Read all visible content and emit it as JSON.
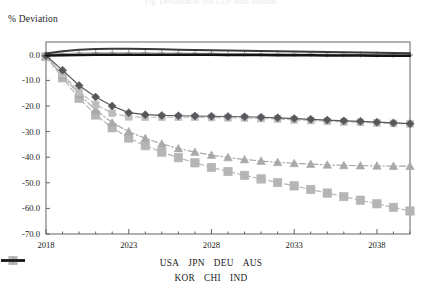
{
  "figure": {
    "title_partial": "Fig. Deviation of real GDP from baseline",
    "y_axis_title": "% Deviation"
  },
  "chart_data": {
    "type": "line",
    "title": "% Deviation",
    "xlabel": "",
    "ylabel": "% Deviation",
    "xlim": [
      2018,
      2040
    ],
    "ylim": [
      -70,
      5
    ],
    "yticks": [
      "0.0",
      "-10.0",
      "-20.0",
      "-30.0",
      "-40.0",
      "-50.0",
      "-60.0",
      "-70.0"
    ],
    "ytick_values": [
      0,
      -10,
      -20,
      -30,
      -40,
      -50,
      -60,
      -70
    ],
    "xticks": [
      "2018",
      "2023",
      "2028",
      "2033",
      "2038"
    ],
    "xtick_values": [
      2018,
      2023,
      2028,
      2033,
      2038
    ],
    "grid": false,
    "legend_position": "bottom",
    "x": [
      2018,
      2019,
      2020,
      2021,
      2022,
      2023,
      2024,
      2025,
      2026,
      2027,
      2028,
      2029,
      2030,
      2031,
      2032,
      2033,
      2034,
      2035,
      2036,
      2037,
      2038,
      2039,
      2040
    ],
    "series": [
      {
        "name": "USA",
        "color": "#58585c",
        "marker": "diamond",
        "linestyle": "solid",
        "values": [
          -0.4,
          -6.0,
          -12.0,
          -16.5,
          -20.0,
          -22.6,
          -23.4,
          -23.7,
          -23.8,
          -23.9,
          -24.0,
          -24.1,
          -24.2,
          -24.4,
          -24.6,
          -24.9,
          -25.2,
          -25.5,
          -25.8,
          -26.0,
          -26.3,
          -26.6,
          -26.9
        ]
      },
      {
        "name": "JPN",
        "color": "#bdbdbd",
        "marker": "square",
        "linestyle": "dashed",
        "values": [
          -0.5,
          -7.5,
          -14.5,
          -19.5,
          -22.8,
          -24.2,
          -24.4,
          -24.4,
          -24.4,
          -24.4,
          -24.5,
          -24.6,
          -24.7,
          -24.9,
          -25.1,
          -25.4,
          -25.7,
          -26.0,
          -26.2,
          -26.4,
          -26.6,
          -26.8,
          -27.0
        ]
      },
      {
        "name": "DEU",
        "color": "#a9a9a9",
        "marker": "triangle",
        "linestyle": "dashdot",
        "values": [
          -0.6,
          -8.0,
          -15.5,
          -21.5,
          -26.5,
          -30.0,
          -32.6,
          -34.8,
          -36.6,
          -38.0,
          -39.2,
          -40.1,
          -40.9,
          -41.5,
          -42.0,
          -42.4,
          -42.7,
          -43.0,
          -43.2,
          -43.3,
          -43.4,
          -43.5,
          -43.5
        ]
      },
      {
        "name": "AUS",
        "color": "#3a3a3c",
        "marker": "none",
        "linestyle": "solid-thick",
        "values": [
          0.5,
          1.4,
          2.0,
          2.3,
          2.4,
          2.4,
          2.3,
          2.2,
          2.0,
          1.9,
          1.8,
          1.7,
          1.6,
          1.5,
          1.4,
          1.3,
          1.2,
          1.1,
          1.0,
          0.9,
          0.8,
          0.7,
          0.6
        ]
      },
      {
        "name": "KOR",
        "color": "#b5b5b5",
        "marker": "square-large",
        "linestyle": "dashed",
        "values": [
          -0.7,
          -9.0,
          -17.0,
          -23.5,
          -28.5,
          -32.5,
          -35.5,
          -38.0,
          -40.2,
          -42.2,
          -44.0,
          -45.6,
          -47.1,
          -48.5,
          -49.9,
          -51.2,
          -52.6,
          -54.0,
          -55.4,
          -56.8,
          -58.2,
          -59.6,
          -61.0
        ]
      },
      {
        "name": "CHI",
        "color": "#9a9a9a",
        "marker": "plus",
        "linestyle": "solid-thin",
        "values": [
          0.2,
          0.5,
          0.7,
          0.8,
          0.8,
          0.8,
          0.8,
          0.7,
          0.7,
          0.6,
          0.6,
          0.5,
          0.5,
          0.4,
          0.4,
          0.3,
          0.3,
          0.2,
          0.2,
          0.1,
          0.1,
          0.0,
          0.0
        ]
      },
      {
        "name": "IND",
        "color": "#141414",
        "marker": "none",
        "linestyle": "solid-heavy",
        "values": [
          -0.3,
          -0.2,
          -0.1,
          0.0,
          0.0,
          0.0,
          0.0,
          0.0,
          0.0,
          0.0,
          0.0,
          -0.1,
          -0.1,
          -0.1,
          -0.2,
          -0.2,
          -0.2,
          -0.3,
          -0.3,
          -0.3,
          -0.4,
          -0.4,
          -0.4
        ]
      }
    ]
  },
  "legend": {
    "row1": [
      {
        "label": "USA"
      },
      {
        "label": "JPN"
      },
      {
        "label": "DEU"
      },
      {
        "label": "AUS"
      }
    ],
    "row2": [
      {
        "label": "KOR"
      },
      {
        "label": "CHI"
      },
      {
        "label": "IND"
      }
    ]
  }
}
